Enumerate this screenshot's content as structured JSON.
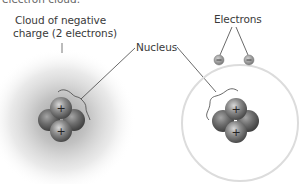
{
  "diagram": {
    "type": "atom-models-comparison",
    "top_cut_text": "electron cloud.",
    "left_model": {
      "label_line1": "Cloud of negative",
      "label_line2": "charge (2 electrons)",
      "cloud_color": "#9a9a9a",
      "nucleus_particles": 4,
      "proton_symbol": "+"
    },
    "right_model": {
      "electrons_label": "Electrons",
      "electron_count": 2,
      "electron_symbol": "−",
      "orbit_color": "#d9d9d9",
      "nucleus_particles": 4,
      "proton_symbol": "+"
    },
    "shared_label": "Nucleus",
    "colors": {
      "text": "#3a3a3a",
      "leader_line": "#444444",
      "particle_dark": "#5a5a5a",
      "particle_light": "#bdbdbd"
    }
  }
}
